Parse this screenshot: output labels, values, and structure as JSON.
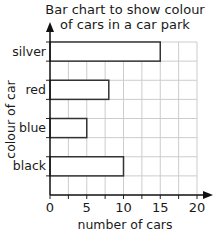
{
  "chart_data": {
    "type": "bar",
    "orientation": "horizontal",
    "title": "Bar chart to show colour of cars in a car park",
    "title_lines": [
      "Bar chart to show colour",
      "of cars in a car park"
    ],
    "categories": [
      "silver",
      "red",
      "blue",
      "black"
    ],
    "values": [
      15,
      8,
      5,
      10
    ],
    "xlabel": "number of cars",
    "ylabel": "colour of car",
    "xlim": [
      0,
      20
    ],
    "xticks": [
      0,
      5,
      10,
      15,
      20
    ],
    "grid": true,
    "grid_step": 2.5,
    "legend": null,
    "bar_fill": "#ffffff",
    "bar_edge": "#333333",
    "grid_color": "#cccccc"
  }
}
